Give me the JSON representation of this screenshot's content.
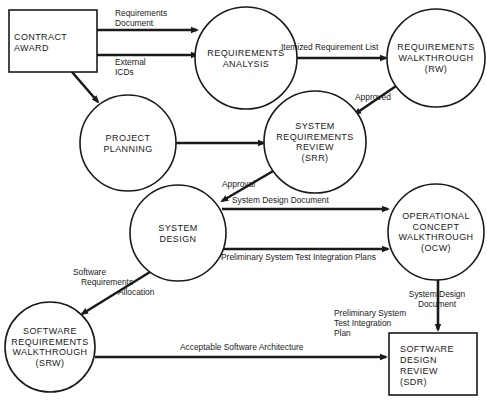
{
  "diagram": {
    "type": "flow",
    "nodes": [
      {
        "id": "contract_award",
        "shape": "box",
        "lines": [
          "CONTRACT",
          "AWARD"
        ]
      },
      {
        "id": "requirements_analysis",
        "shape": "circle",
        "lines": [
          "REQUIREMENTS",
          "ANALYSIS"
        ]
      },
      {
        "id": "requirements_walkthrough",
        "shape": "circle",
        "lines": [
          "REQUIREMENTS",
          "WALKTHROUGH",
          "(RW)"
        ]
      },
      {
        "id": "project_planning",
        "shape": "circle",
        "lines": [
          "PROJECT",
          "PLANNING"
        ]
      },
      {
        "id": "system_requirements_review",
        "shape": "circle",
        "lines": [
          "SYSTEM",
          "REQUIREMENTS",
          "REVIEW",
          "(SRR)"
        ]
      },
      {
        "id": "system_design",
        "shape": "circle",
        "lines": [
          "SYSTEM",
          "DESIGN"
        ]
      },
      {
        "id": "operational_concept_walkthrough",
        "shape": "circle",
        "lines": [
          "OPERATIONAL",
          "CONCEPT",
          "WALKTHROUGH",
          "(OCW)"
        ]
      },
      {
        "id": "software_requirements_walkthrough",
        "shape": "circle",
        "lines": [
          "SOFTWARE",
          "REQUIREMENTS",
          "WALKTHROUGH",
          "(SRW)"
        ]
      },
      {
        "id": "software_design_review",
        "shape": "box",
        "lines": [
          "SOFTWARE",
          "DESIGN",
          "REVIEW",
          "(SDR)"
        ]
      }
    ],
    "edges": [
      {
        "id": "e1",
        "from": "contract_award",
        "to": "requirements_analysis",
        "label": [
          "Requirements",
          "Document"
        ]
      },
      {
        "id": "e2",
        "from": "contract_award",
        "to": "requirements_analysis",
        "label": [
          "External",
          "ICDs"
        ]
      },
      {
        "id": "e3",
        "from": "contract_award",
        "to": "project_planning",
        "label": []
      },
      {
        "id": "e4",
        "from": "requirements_analysis",
        "to": "requirements_walkthrough",
        "label": [
          "Itemized Requirement List"
        ]
      },
      {
        "id": "e5",
        "from": "requirements_walkthrough",
        "to": "system_requirements_review",
        "label": [
          "Approved"
        ]
      },
      {
        "id": "e6",
        "from": "project_planning",
        "to": "system_requirements_review",
        "label": []
      },
      {
        "id": "e7",
        "from": "system_requirements_review",
        "to": "system_design",
        "label": [
          "Approval"
        ]
      },
      {
        "id": "e8",
        "from": "system_design",
        "to": "operational_concept_walkthrough",
        "label": [
          "System Design Document"
        ]
      },
      {
        "id": "e9",
        "from": "system_design",
        "to": "operational_concept_walkthrough",
        "label": [
          "Preliminary System Test Integration Plans"
        ]
      },
      {
        "id": "e10",
        "from": "system_design",
        "to": "software_requirements_walkthrough",
        "label": [
          "Software",
          "Requirements",
          "Allocation"
        ]
      },
      {
        "id": "e11",
        "from": "operational_concept_walkthrough",
        "to": "software_design_review",
        "label": [
          "System Design",
          "Document"
        ]
      },
      {
        "id": "e12",
        "from": "software_requirements_walkthrough",
        "to": "software_design_review",
        "label": [
          "Acceptable Software Architecture"
        ]
      },
      {
        "id": "e13",
        "from": "operational_concept_walkthrough",
        "to": "software_design_review",
        "label": [
          "Preliminary System",
          "Test Integration",
          "Plan"
        ]
      }
    ]
  }
}
